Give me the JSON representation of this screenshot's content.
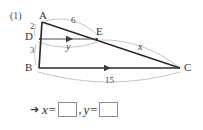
{
  "problem": {
    "number": "(1)"
  },
  "figure": {
    "vertices": [
      {
        "name": "A",
        "label": "A",
        "x": 44,
        "y": 17
      },
      {
        "name": "D",
        "label": "D",
        "x": 30,
        "y": 38
      },
      {
        "name": "B",
        "label": "B",
        "x": 29,
        "y": 69
      },
      {
        "name": "E",
        "label": "E",
        "x": 101,
        "y": 33
      },
      {
        "name": "C",
        "label": "C",
        "x": 188,
        "y": 69
      }
    ],
    "measures": [
      {
        "name": "ad-length",
        "label": "2",
        "x": 33,
        "y": 27
      },
      {
        "name": "db-length",
        "label": "3",
        "x": 33,
        "y": 51
      },
      {
        "name": "ae-length",
        "label": "6",
        "x": 74,
        "y": 21
      },
      {
        "name": "ec-length",
        "label": "x",
        "x": 141,
        "y": 47
      },
      {
        "name": "de-length",
        "label": "y",
        "x": 69,
        "y": 47
      },
      {
        "name": "bc-length",
        "label": "15",
        "x": 109,
        "y": 80
      }
    ],
    "colors": {
      "solid_line": "#2b2b2b",
      "arc_line": "#b8b8b8",
      "arrow_line": "#555555",
      "box_border": "#8d8d8d"
    }
  },
  "answer": {
    "arrow": "➜",
    "x_label": "x=",
    "separator": ",",
    "y_label": "y=",
    "x_value": "",
    "y_value": ""
  }
}
